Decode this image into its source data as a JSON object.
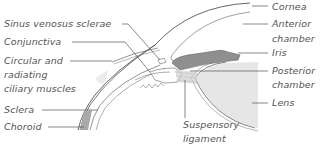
{
  "diagram": {
    "labels_left": [
      {
        "id": "sinus-venosus-sclerae",
        "text": "Sinus venosus sclerae"
      },
      {
        "id": "conjunctiva",
        "text": "Conjunctiva"
      },
      {
        "id": "ciliary-muscles",
        "lines": [
          "Circular and",
          "radiating",
          "ciliary muscles"
        ]
      },
      {
        "id": "sclera",
        "text": "Sclera"
      },
      {
        "id": "choroid",
        "text": "Choroid"
      }
    ],
    "labels_right": [
      {
        "id": "cornea",
        "text": "Cornea"
      },
      {
        "id": "anterior-chamber",
        "lines": [
          "Anterior",
          "chamber"
        ]
      },
      {
        "id": "iris",
        "text": "Iris"
      },
      {
        "id": "posterior-chamber",
        "lines": [
          "Posterior",
          "chamber"
        ]
      },
      {
        "id": "lens",
        "text": "Lens"
      }
    ],
    "labels_bottom": [
      {
        "id": "suspensory-ligament",
        "lines": [
          "Suspensory",
          "ligament"
        ]
      }
    ],
    "colors": {
      "outline": "#555555",
      "label_text": "#555555",
      "iris_fill": "#8f8f8f",
      "lens_fill": "#e6e6e6",
      "choroid_fill": "#a9a9a9",
      "muscle_fill": "#d9d9d9"
    }
  }
}
